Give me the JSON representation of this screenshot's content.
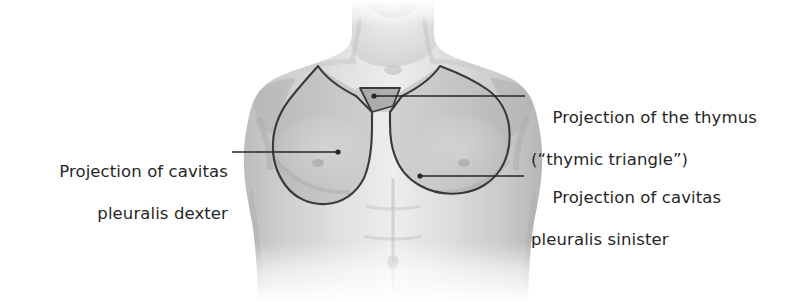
{
  "figure": {
    "background_color": "#ffffff",
    "ink_color": "#262626",
    "outline_color": "#3a3a3a",
    "skin_light": "#e8e8e8",
    "skin_mid": "#d2d2d2",
    "skin_shadow": "#bdbdbd",
    "projection_fill": "#b9b9b9",
    "thymus_fill": "#a8a8a8"
  },
  "labels": {
    "pleura_dexter": {
      "line1": "Projection of cavitas",
      "line2": "pleuralis dexter",
      "align": "right"
    },
    "thymus": {
      "line1": "Projection of the thymus",
      "line2": "(“thymic triangle”)",
      "align": "left"
    },
    "pleura_sinister": {
      "line1": "Projection of cavitas",
      "line2": "pleuralis sinister",
      "align": "left"
    }
  },
  "leaders": [
    {
      "name": "leader-pleura-dexter",
      "from_x": 232,
      "from_y": 152,
      "to_x": 338,
      "to_y": 152,
      "dot_at": "to"
    },
    {
      "name": "leader-thymus",
      "from_x": 374,
      "from_y": 96,
      "to_x": 525,
      "to_y": 96,
      "dot_at": "from"
    },
    {
      "name": "leader-pleura-sinister",
      "from_x": 420,
      "from_y": 176,
      "to_x": 524,
      "to_y": 176,
      "dot_at": "from"
    }
  ]
}
